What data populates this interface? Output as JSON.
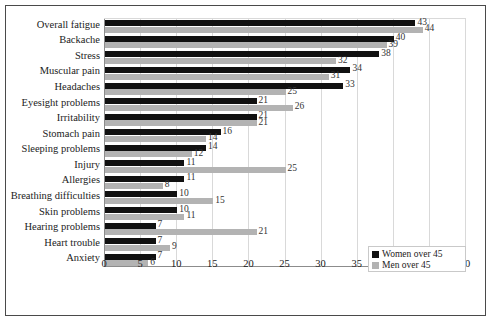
{
  "chart_data": {
    "type": "bar",
    "orientation": "horizontal",
    "title": "",
    "xlabel": "",
    "ylabel": "",
    "xlim": [
      0,
      50
    ],
    "xticks": [
      0,
      5,
      10,
      15,
      20,
      25,
      30,
      35,
      40,
      45,
      50
    ],
    "grid": true,
    "legend_position": "bottom-right",
    "categories": [
      "Overall fatigue",
      "Backache",
      "Stress",
      "Muscular pain",
      "Headaches",
      "Eyesight problems",
      "Irritability",
      "Stomach pain",
      "Sleeping problems",
      "Injury",
      "Allergies",
      "Breathing difficulties",
      "Skin problems",
      "Hearing problems",
      "Heart trouble",
      "Anxiety"
    ],
    "series": [
      {
        "name": "Women over 45",
        "color": "#111111",
        "values": [
          43,
          40,
          38,
          34,
          33,
          21,
          21,
          16,
          14,
          11,
          11,
          10,
          10,
          7,
          7,
          7
        ]
      },
      {
        "name": "Men over 45",
        "color": "#b3b3b3",
        "values": [
          44,
          39,
          32,
          31,
          25,
          26,
          21,
          14,
          12,
          25,
          8,
          15,
          11,
          21,
          9,
          6
        ]
      }
    ]
  },
  "legend": {
    "items": [
      {
        "label": "Women over 45",
        "swatch": "women"
      },
      {
        "label": "Men over 45",
        "swatch": "men"
      }
    ]
  }
}
